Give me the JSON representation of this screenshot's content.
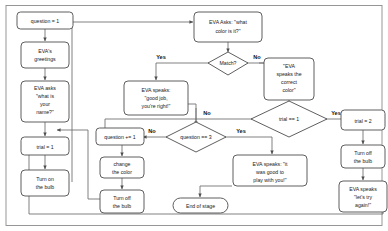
{
  "diagram": {
    "type": "flowchart",
    "canvas": {
      "width": 388,
      "height": 231
    },
    "colors": {
      "node_stroke": "#4d4d4d",
      "node_fill": "#ffffff",
      "edge": "#6b6b6b",
      "text": "#1a1a1a",
      "frame": "#8c8c8c"
    },
    "nodes": [
      {
        "id": "question1",
        "shape": "process",
        "lines": [
          "question = 1"
        ]
      },
      {
        "id": "greetings",
        "shape": "process",
        "lines": [
          "EVA's",
          "greetings"
        ]
      },
      {
        "id": "asks_name",
        "shape": "process",
        "lines": [
          "EVA asks",
          "\"what is",
          "your",
          "name?\""
        ]
      },
      {
        "id": "trial1",
        "shape": "process",
        "lines": [
          "trial = 1"
        ]
      },
      {
        "id": "turn_on",
        "shape": "process",
        "lines": [
          "Turn on",
          "the bulb"
        ]
      },
      {
        "id": "asks_color",
        "shape": "process",
        "lines": [
          "EVA Asks: \"what",
          "color is it?\""
        ]
      },
      {
        "id": "match",
        "shape": "decision",
        "lines": [
          "Match?"
        ]
      },
      {
        "id": "correct_color",
        "shape": "process",
        "lines": [
          "\"EVA",
          "speaks the",
          "correct",
          "color\""
        ]
      },
      {
        "id": "good_job",
        "shape": "process",
        "lines": [
          "EVA speaks:",
          "\"good job,",
          "you're right!\""
        ]
      },
      {
        "id": "trial_eq_1",
        "shape": "decision",
        "lines": [
          "trial == 1"
        ]
      },
      {
        "id": "trial2",
        "shape": "process",
        "lines": [
          "trial = 2"
        ]
      },
      {
        "id": "turn_off_r",
        "shape": "process",
        "lines": [
          "Turn off",
          "the bulb"
        ]
      },
      {
        "id": "try_again",
        "shape": "process",
        "lines": [
          "EVA speaks",
          "\"let's try",
          "again!\""
        ]
      },
      {
        "id": "question_eq_3",
        "shape": "decision",
        "lines": [
          "question == 3"
        ]
      },
      {
        "id": "question_inc",
        "shape": "process",
        "lines": [
          "question += 1"
        ]
      },
      {
        "id": "change_color",
        "shape": "process",
        "lines": [
          "change",
          "the color"
        ]
      },
      {
        "id": "turn_off_m",
        "shape": "process",
        "lines": [
          "Turn off",
          "the bulb"
        ]
      },
      {
        "id": "good_to_play",
        "shape": "process",
        "lines": [
          "EVA speaks: \"it",
          "was good to",
          "play with you!\""
        ]
      },
      {
        "id": "end_of_stage",
        "shape": "terminal",
        "lines": [
          "End of stage"
        ]
      }
    ],
    "edge_labels": {
      "match_yes": "Yes",
      "match_no": "No",
      "trial_yes": "Yes",
      "trial_no": "No",
      "question_yes": "Yes",
      "question_no": "No"
    },
    "edges": [
      {
        "from": "question1",
        "to": "greetings",
        "label": ""
      },
      {
        "from": "greetings",
        "to": "asks_name",
        "label": ""
      },
      {
        "from": "asks_name",
        "to": "trial1",
        "label": ""
      },
      {
        "from": "trial1",
        "to": "turn_on",
        "label": ""
      },
      {
        "from": "turn_on",
        "to": "asks_color",
        "label": ""
      },
      {
        "from": "asks_color",
        "to": "match",
        "label": ""
      },
      {
        "from": "match",
        "to": "good_job",
        "label": "Yes"
      },
      {
        "from": "match",
        "to": "correct_color",
        "label": "No"
      },
      {
        "from": "correct_color",
        "to": "trial_eq_1",
        "label": ""
      },
      {
        "from": "trial_eq_1",
        "to": "trial2",
        "label": "Yes"
      },
      {
        "from": "trial_eq_1",
        "to": "turn_on",
        "label": "No"
      },
      {
        "from": "trial2",
        "to": "turn_off_r",
        "label": ""
      },
      {
        "from": "turn_off_r",
        "to": "try_again",
        "label": ""
      },
      {
        "from": "try_again",
        "to": "trial1",
        "label": ""
      },
      {
        "from": "good_job",
        "to": "question_eq_3",
        "label": ""
      },
      {
        "from": "question_eq_3",
        "to": "question_inc",
        "label": "No"
      },
      {
        "from": "question_eq_3",
        "to": "good_to_play",
        "label": "Yes"
      },
      {
        "from": "question_inc",
        "to": "change_color",
        "label": ""
      },
      {
        "from": "change_color",
        "to": "turn_off_m",
        "label": ""
      },
      {
        "from": "turn_off_m",
        "to": "trial1",
        "label": ""
      },
      {
        "from": "good_to_play",
        "to": "end_of_stage",
        "label": ""
      }
    ]
  }
}
